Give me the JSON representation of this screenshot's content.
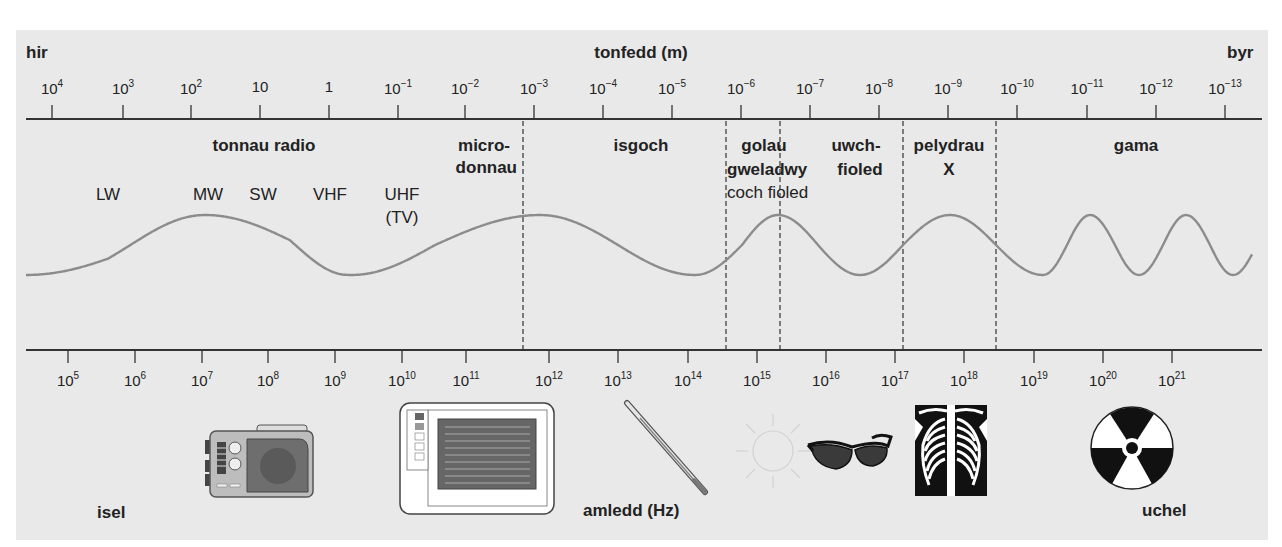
{
  "wavelength_axis": {
    "title": "tonfedd (m)",
    "left_label": "hir",
    "right_label": "byr",
    "ticks": [
      {
        "base": "10",
        "exp": "4",
        "x": 52
      },
      {
        "base": "10",
        "exp": "3",
        "x": 123
      },
      {
        "base": "10",
        "exp": "2",
        "x": 191
      },
      {
        "base": "10",
        "exp": "",
        "x": 260
      },
      {
        "base": "1",
        "exp": "",
        "x": 329
      },
      {
        "base": "10",
        "exp": "−1",
        "x": 398
      },
      {
        "base": "10",
        "exp": "−2",
        "x": 465
      },
      {
        "base": "10",
        "exp": "−3",
        "x": 534
      },
      {
        "base": "10",
        "exp": "−4",
        "x": 603
      },
      {
        "base": "10",
        "exp": "−5",
        "x": 672
      },
      {
        "base": "10",
        "exp": "−6",
        "x": 741
      },
      {
        "base": "10",
        "exp": "−7",
        "x": 810
      },
      {
        "base": "10",
        "exp": "−8",
        "x": 879
      },
      {
        "base": "10",
        "exp": "−9",
        "x": 948
      },
      {
        "base": "10",
        "exp": "−10",
        "x": 1017
      },
      {
        "base": "10",
        "exp": "−11",
        "x": 1087
      },
      {
        "base": "10",
        "exp": "−12",
        "x": 1156
      },
      {
        "base": "10",
        "exp": "−13",
        "x": 1225
      }
    ]
  },
  "frequency_axis": {
    "title": "amledd (Hz)",
    "left_label": "isel",
    "right_label": "uchel",
    "ticks": [
      {
        "base": "10",
        "exp": "5",
        "x": 68
      },
      {
        "base": "10",
        "exp": "6",
        "x": 135
      },
      {
        "base": "10",
        "exp": "7",
        "x": 202
      },
      {
        "base": "10",
        "exp": "8",
        "x": 268
      },
      {
        "base": "10",
        "exp": "9",
        "x": 335
      },
      {
        "base": "10",
        "exp": "10",
        "x": 402
      },
      {
        "base": "10",
        "exp": "11",
        "x": 466
      },
      {
        "base": "10",
        "exp": "12",
        "x": 549
      },
      {
        "base": "10",
        "exp": "13",
        "x": 618
      },
      {
        "base": "10",
        "exp": "14",
        "x": 688
      },
      {
        "base": "10",
        "exp": "15",
        "x": 757
      },
      {
        "base": "10",
        "exp": "16",
        "x": 826
      },
      {
        "base": "10",
        "exp": "17",
        "x": 895
      },
      {
        "base": "10",
        "exp": "18",
        "x": 964
      },
      {
        "base": "10",
        "exp": "19",
        "x": 1034
      },
      {
        "base": "10",
        "exp": "20",
        "x": 1103
      },
      {
        "base": "10",
        "exp": "21",
        "x": 1172
      }
    ]
  },
  "regions": {
    "radio": {
      "label": "tonnau radio"
    },
    "microwave": {
      "line1": "micro-",
      "line2": "donnau"
    },
    "infrared": {
      "label": "isgoch"
    },
    "visible": {
      "line1": "golau",
      "line2": "gweladwy",
      "sub": "coch fioled"
    },
    "ultraviolet": {
      "line1": "uwch-",
      "line2": "fioled"
    },
    "xray": {
      "line1": "pelydrau",
      "line2": "X"
    },
    "gamma": {
      "label": "gama"
    }
  },
  "radio_bands": [
    {
      "label": "LW",
      "x": 108
    },
    {
      "label": "MW",
      "x": 208
    },
    {
      "label": "SW",
      "x": 263
    },
    {
      "label": "VHF",
      "x": 330
    },
    {
      "label": "UHF",
      "x": 402
    },
    {
      "label": "(TV)",
      "x": 402
    }
  ],
  "boundaries_x": [
    523,
    726,
    780,
    903,
    996
  ],
  "illustrations": [
    {
      "name": "radio",
      "x": 205
    },
    {
      "name": "microwave-oven",
      "x": 400
    },
    {
      "name": "thermometer",
      "x": 625
    },
    {
      "name": "sun",
      "x": 770
    },
    {
      "name": "sunglasses",
      "x": 810
    },
    {
      "name": "chest-x-ray",
      "x": 915
    },
    {
      "name": "radiation-symbol",
      "x": 1130
    }
  ],
  "colors": {
    "panel": "#e9e9e9",
    "wave": "#8c8c8c",
    "axis": "#333333",
    "text": "#222222"
  }
}
